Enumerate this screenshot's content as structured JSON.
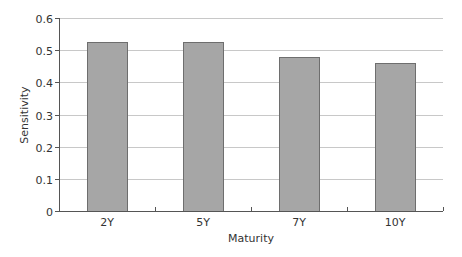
{
  "chart_data": {
    "type": "bar",
    "title": "",
    "xlabel": "Maturity",
    "ylabel": "Sensitivity",
    "categories": [
      "2Y",
      "5Y",
      "7Y",
      "10Y"
    ],
    "values": [
      0.525,
      0.525,
      0.48,
      0.46
    ],
    "ylim": [
      0,
      0.6
    ],
    "yticks": [
      0,
      0.1,
      0.2,
      0.3,
      0.4,
      0.5,
      0.6
    ],
    "ytick_labels": [
      "0",
      "0.1",
      "0.2",
      "0.3",
      "0.4",
      "0.5",
      "0.6"
    ],
    "grid": true,
    "legend": null,
    "colors": {
      "bar": "#a6a6a6",
      "bar_edge": "#6e6e6e",
      "grid": "#c8c8c8",
      "axis": "#555555"
    }
  }
}
